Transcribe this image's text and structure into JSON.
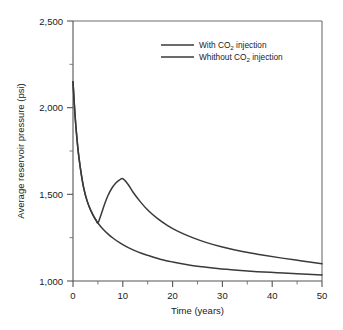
{
  "chart_data": {
    "type": "line",
    "title": "",
    "xlabel": "Time (years)",
    "ylabel": "Average reservoir pressure (psi)",
    "xlim": [
      0,
      50
    ],
    "ylim": [
      1000,
      2500
    ],
    "xticks": [
      0,
      10,
      20,
      30,
      40,
      50
    ],
    "xtick_labels": [
      "0",
      "10",
      "20",
      "30",
      "40",
      "50"
    ],
    "xticks_minor": [
      5,
      15,
      25,
      35,
      45
    ],
    "yticks": [
      1000,
      1500,
      2000,
      2500
    ],
    "ytick_labels": [
      "1,000",
      "1,500",
      "2,000",
      "2,500"
    ],
    "yticks_minor": [
      1250,
      1750,
      2250
    ],
    "grid": false,
    "legend_position": "upper-right-inside",
    "series": [
      {
        "name": "With CO2 injection",
        "label_prefix": "With CO",
        "label_sub": "2",
        "label_suffix": " injection",
        "color": "#3a3a3a",
        "x": [
          0,
          0.4,
          0.8,
          1.2,
          1.7,
          2.2,
          2.8,
          3.4,
          4.0,
          4.6,
          5.0,
          5.6,
          6.3,
          7.0,
          7.8,
          8.6,
          9.3,
          10.0,
          11.0,
          12.0,
          13.5,
          15.0,
          17.0,
          19.0,
          21.0,
          24.0,
          27.0,
          30.0,
          34.0,
          38.0,
          42.0,
          46.0,
          50.0
        ],
        "y": [
          2150,
          1960,
          1820,
          1710,
          1610,
          1530,
          1465,
          1418,
          1382,
          1352,
          1335,
          1380,
          1440,
          1492,
          1535,
          1565,
          1582,
          1590,
          1560,
          1515,
          1458,
          1410,
          1360,
          1320,
          1288,
          1250,
          1220,
          1196,
          1170,
          1150,
          1132,
          1116,
          1100
        ]
      },
      {
        "name": "Whithout CO2 injection",
        "label_prefix": "Whithout CO",
        "label_sub": "2",
        "label_suffix": " injection",
        "color": "#3a3a3a",
        "x": [
          0,
          0.4,
          0.8,
          1.2,
          1.7,
          2.2,
          2.8,
          3.4,
          4.0,
          4.6,
          5.0,
          6.0,
          7.0,
          8.0,
          9.5,
          11.0,
          13.0,
          15.0,
          17.5,
          20.0,
          23.0,
          26.0,
          29.0,
          33.0,
          37.0,
          41.0,
          45.0,
          50.0
        ],
        "y": [
          2150,
          1960,
          1820,
          1710,
          1610,
          1530,
          1465,
          1418,
          1382,
          1352,
          1335,
          1300,
          1272,
          1248,
          1218,
          1194,
          1168,
          1148,
          1126,
          1110,
          1094,
          1082,
          1072,
          1062,
          1054,
          1048,
          1042,
          1035
        ]
      }
    ]
  },
  "legend": {
    "entries": [
      {
        "text": "With CO2 injection"
      },
      {
        "text": "Whithout CO2 injection"
      }
    ]
  },
  "axes": {
    "x_title": "Time (years)",
    "y_title": "Average reservoir pressure (psi)"
  }
}
